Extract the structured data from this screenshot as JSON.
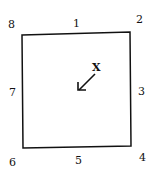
{
  "diagram": {
    "labels": {
      "l1": "1",
      "l2": "2",
      "l3": "3",
      "l4": "4",
      "l5": "5",
      "l6": "6",
      "l7": "7",
      "l8": "8",
      "x": "X"
    },
    "arrow_icon": "arrow-down-left-icon"
  }
}
